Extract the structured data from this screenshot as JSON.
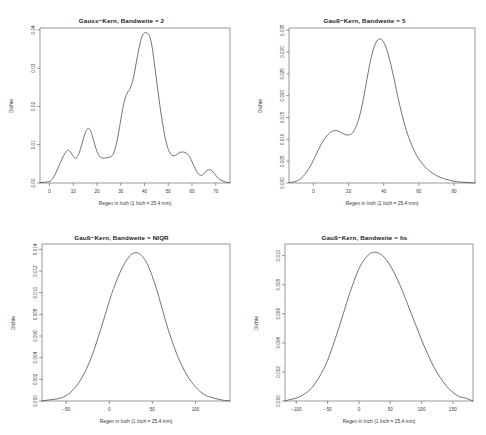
{
  "figure": {
    "background": "#ffffff",
    "line_color": "#444444",
    "axis_color": "#555555",
    "layout": "2x2"
  },
  "chart_data": [
    {
      "type": "line",
      "id": "panel-1",
      "title": "Gauss−Kern, Bandweite = 2",
      "xlabel": "Regen in Inch (1 Inch = 25.4 mm)",
      "ylabel": "Dichte",
      "xlim": [
        -4,
        76
      ],
      "ylim": [
        0,
        0.0405
      ],
      "xticks": [
        0,
        10,
        20,
        30,
        40,
        50,
        60,
        70
      ],
      "xticklabels": [
        "0",
        "10",
        "20",
        "30",
        "40",
        "50",
        "60",
        "70"
      ],
      "yticks": [
        0.0,
        0.01,
        0.02,
        0.03,
        0.04
      ],
      "yticklabels": [
        "0.00",
        "0.01",
        "0.02",
        "0.03",
        "0.04"
      ],
      "grid": false,
      "legend": "none",
      "x": [
        -4,
        -2,
        0,
        1,
        2,
        3,
        4,
        5,
        6,
        7,
        8,
        9,
        10,
        11,
        12,
        13,
        14,
        15,
        16,
        17,
        18,
        19,
        20,
        21,
        22,
        23,
        24,
        25,
        26,
        27,
        28,
        29,
        30,
        31,
        32,
        33,
        34,
        35,
        36,
        37,
        38,
        39,
        40,
        41,
        42,
        43,
        44,
        45,
        46,
        47,
        48,
        49,
        50,
        51,
        52,
        53,
        54,
        55,
        56,
        57,
        58,
        59,
        60,
        61,
        62,
        63,
        64,
        65,
        66,
        67,
        68,
        69,
        70,
        71,
        72,
        74,
        76
      ],
      "y": [
        0.0001,
        0.0002,
        0.0004,
        0.0009,
        0.0018,
        0.0031,
        0.0046,
        0.0059,
        0.0072,
        0.0082,
        0.0086,
        0.008,
        0.007,
        0.0065,
        0.0071,
        0.0088,
        0.011,
        0.013,
        0.0142,
        0.014,
        0.0124,
        0.0102,
        0.0082,
        0.007,
        0.0066,
        0.0065,
        0.0066,
        0.0067,
        0.0069,
        0.0078,
        0.0098,
        0.0128,
        0.0165,
        0.02,
        0.0224,
        0.0238,
        0.0248,
        0.0266,
        0.0296,
        0.033,
        0.0362,
        0.0384,
        0.0392,
        0.0392,
        0.0386,
        0.0362,
        0.032,
        0.0272,
        0.0224,
        0.018,
        0.0142,
        0.011,
        0.0088,
        0.0076,
        0.0071,
        0.0072,
        0.0076,
        0.008,
        0.0081,
        0.008,
        0.0076,
        0.0068,
        0.0056,
        0.0042,
        0.003,
        0.0022,
        0.002,
        0.0024,
        0.0031,
        0.0035,
        0.0034,
        0.0028,
        0.002,
        0.0013,
        0.0008,
        0.0003,
        0.0001
      ]
    },
    {
      "type": "line",
      "id": "panel-2",
      "title": "Gauß−Kern, Bandweite = 5",
      "xlabel": "Regen in Inch (1 Inch = 25.4 mm)",
      "ylabel": "Dichte",
      "xlim": [
        -14,
        92
      ],
      "ylim": [
        0,
        0.0355
      ],
      "xticks": [
        0,
        20,
        40,
        60,
        80
      ],
      "xticklabels": [
        "0",
        "20",
        "40",
        "60",
        "80"
      ],
      "yticks": [
        0.0,
        0.005,
        0.01,
        0.015,
        0.02,
        0.025,
        0.03,
        0.035
      ],
      "yticklabels": [
        "0.000",
        "0.005",
        "0.010",
        "0.015",
        "0.020",
        "0.025",
        "0.030",
        "0.035"
      ],
      "grid": false,
      "legend": "none",
      "x": [
        -14,
        -12,
        -10,
        -8,
        -6,
        -4,
        -2,
        0,
        2,
        4,
        6,
        8,
        10,
        12,
        14,
        16,
        18,
        20,
        22,
        24,
        26,
        28,
        30,
        32,
        34,
        36,
        38,
        40,
        42,
        44,
        46,
        48,
        50,
        52,
        54,
        56,
        58,
        60,
        64,
        68,
        72,
        76,
        80,
        84,
        88,
        92
      ],
      "y": [
        0.0001,
        0.0002,
        0.0004,
        0.0008,
        0.0015,
        0.0025,
        0.0038,
        0.0053,
        0.007,
        0.0086,
        0.01,
        0.011,
        0.0117,
        0.012,
        0.0119,
        0.0115,
        0.0111,
        0.011,
        0.0114,
        0.0127,
        0.015,
        0.0185,
        0.0228,
        0.0272,
        0.0305,
        0.0325,
        0.033,
        0.0322,
        0.0302,
        0.0272,
        0.0236,
        0.0198,
        0.0163,
        0.0132,
        0.0107,
        0.0086,
        0.0069,
        0.0055,
        0.0035,
        0.0022,
        0.0013,
        0.0008,
        0.0004,
        0.0002,
        0.0001,
        0.0
      ]
    },
    {
      "type": "line",
      "id": "panel-3",
      "title": "Gauß−Kern, Bandweite = NIQR",
      "xlabel": "Regen in Inch (1 Inch = 25.4 mm)",
      "ylabel": "Dichte",
      "xlim": [
        -78,
        140
      ],
      "ylim": [
        0,
        0.0145
      ],
      "xticks": [
        -50,
        0,
        50,
        100
      ],
      "xticklabels": [
        "−50",
        "0",
        "50",
        "100"
      ],
      "yticks": [
        0.0,
        0.002,
        0.004,
        0.006,
        0.008,
        0.01,
        0.012,
        0.014
      ],
      "yticklabels": [
        "0.000",
        "0.002",
        "0.004",
        "0.006",
        "0.008",
        "0.010",
        "0.012",
        "0.014"
      ],
      "grid": false,
      "legend": "none",
      "x": [
        -78,
        -70,
        -60,
        -50,
        -40,
        -30,
        -20,
        -10,
        0,
        5,
        10,
        15,
        20,
        25,
        30,
        35,
        40,
        45,
        50,
        55,
        60,
        65,
        70,
        80,
        90,
        100,
        110,
        120,
        130,
        140
      ],
      "y": [
        0.0,
        0.0001,
        0.0002,
        0.0005,
        0.0012,
        0.0024,
        0.0042,
        0.0066,
        0.0092,
        0.0104,
        0.0114,
        0.0123,
        0.013,
        0.0135,
        0.0137,
        0.0136,
        0.0132,
        0.0125,
        0.0115,
        0.0103,
        0.0089,
        0.0075,
        0.0062,
        0.004,
        0.0024,
        0.0013,
        0.0006,
        0.0003,
        0.0001,
        0.0
      ]
    },
    {
      "type": "line",
      "id": "panel-4",
      "title": "Gauß−Kern, Bandweite = hs",
      "xlabel": "Regen in Inch (1 Inch = 25.4 mm)",
      "ylabel": "Dichte",
      "xlim": [
        -118,
        182
      ],
      "ylim": [
        0,
        0.0108
      ],
      "xticks": [
        -100,
        -50,
        0,
        50,
        100,
        150
      ],
      "xticklabels": [
        "−100",
        "−50",
        "0",
        "50",
        "100",
        "150"
      ],
      "yticks": [
        0.0,
        0.002,
        0.004,
        0.006,
        0.008,
        0.01
      ],
      "yticklabels": [
        "0.000",
        "0.002",
        "0.004",
        "0.006",
        "0.008",
        "0.010"
      ],
      "grid": false,
      "legend": "none",
      "x": [
        -118,
        -110,
        -100,
        -90,
        -80,
        -70,
        -60,
        -50,
        -40,
        -30,
        -20,
        -10,
        0,
        10,
        20,
        30,
        40,
        50,
        60,
        70,
        80,
        90,
        100,
        110,
        120,
        130,
        140,
        150,
        160,
        170,
        182
      ],
      "y": [
        0.0,
        0.0001,
        0.0002,
        0.0004,
        0.0007,
        0.0012,
        0.0019,
        0.0028,
        0.004,
        0.0053,
        0.0067,
        0.008,
        0.0091,
        0.0098,
        0.0102,
        0.0102,
        0.0099,
        0.0093,
        0.0085,
        0.0075,
        0.0064,
        0.0053,
        0.0042,
        0.0032,
        0.0023,
        0.0016,
        0.001,
        0.0006,
        0.0003,
        0.0002,
        0.0
      ]
    }
  ]
}
